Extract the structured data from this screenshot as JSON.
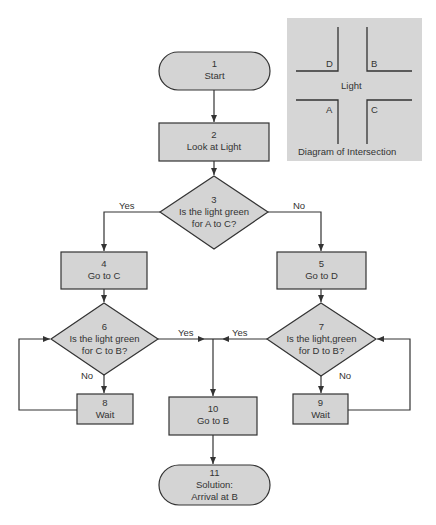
{
  "colors": {
    "shape_fill": "#d4d4d4",
    "panel_fill": "#d6d6d6",
    "stroke": "#333333",
    "background": "#ffffff"
  },
  "nodes": {
    "n1": {
      "num": "1",
      "text": "Start",
      "shape": "terminator"
    },
    "n2": {
      "num": "2",
      "text": "Look at Light",
      "shape": "process"
    },
    "n3": {
      "num": "3",
      "line1": "Is the light green",
      "line2": "for A to C?",
      "shape": "decision"
    },
    "n4": {
      "num": "4",
      "text": "Go to C",
      "shape": "process"
    },
    "n5": {
      "num": "5",
      "text": "Go to D",
      "shape": "process"
    },
    "n6": {
      "num": "6",
      "line1": "Is the light green",
      "line2": "for C to B?",
      "shape": "decision"
    },
    "n7": {
      "num": "7",
      "line1": "Is the light,green",
      "line2": "for D to B?",
      "shape": "decision"
    },
    "n8": {
      "num": "8",
      "text": "Wait",
      "shape": "process"
    },
    "n9": {
      "num": "9",
      "text": "Wait",
      "shape": "process"
    },
    "n10": {
      "num": "10",
      "text": "Go to B",
      "shape": "process"
    },
    "n11": {
      "num": "11",
      "line1": "Solution:",
      "line2": "Arrival at B",
      "shape": "terminator"
    }
  },
  "edges": {
    "e3_yes": "Yes",
    "e3_no": "No",
    "e6_yes": "Yes",
    "e6_no": "No",
    "e7_yes": "Yes",
    "e7_no": "No"
  },
  "intersection": {
    "corner_d": "D",
    "corner_b": "B",
    "corner_a": "A",
    "corner_c": "C",
    "center": "Light",
    "caption": "Diagram of Intersection"
  }
}
